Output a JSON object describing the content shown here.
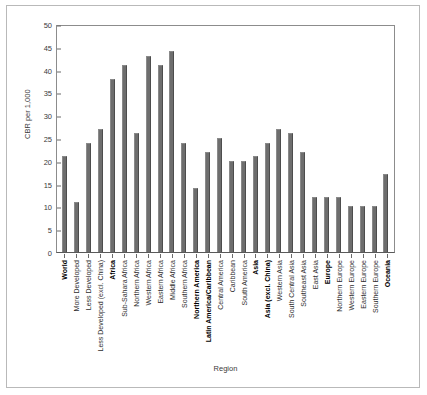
{
  "chart_data": {
    "type": "bar",
    "title": "",
    "xlabel": "Region",
    "ylabel": "CBR per 1,000",
    "ylim": [
      0,
      50
    ],
    "ytick_step": 5,
    "yticks": [
      0,
      5,
      10,
      15,
      20,
      25,
      30,
      35,
      40,
      45,
      50
    ],
    "grid": false,
    "legend": null,
    "bar_color": "#6e6e6e",
    "categories": [
      "World",
      "More Developed",
      "Less Developed",
      "Less Developed (excl. China)",
      "Africa",
      "Sub-Sahara Africa",
      "Northern Africa",
      "Western Africa",
      "Eastern Africa",
      "Middle Africa",
      "Southern Africa",
      "Northern America",
      "Latin America/Caribbean",
      "Central America",
      "Caribbean",
      "South America",
      "Asia",
      "Asia (excl. China)",
      "Western Asia",
      "South Central Asia",
      "Southeast Asia",
      "East Asia",
      "Europe",
      "Northern Europe",
      "Western Europe",
      "Eastern Europe",
      "Southern Europe",
      "Oceania"
    ],
    "emphasis": [
      true,
      false,
      false,
      false,
      true,
      false,
      false,
      false,
      false,
      false,
      false,
      true,
      true,
      false,
      false,
      false,
      true,
      true,
      false,
      false,
      false,
      false,
      true,
      false,
      false,
      false,
      false,
      true
    ],
    "values": [
      21,
      11,
      24,
      27,
      38,
      41,
      26,
      43,
      41,
      44,
      24,
      14,
      22,
      25,
      20,
      20,
      21,
      24,
      27,
      26,
      22,
      12,
      12,
      12,
      10,
      10,
      10,
      17
    ]
  }
}
